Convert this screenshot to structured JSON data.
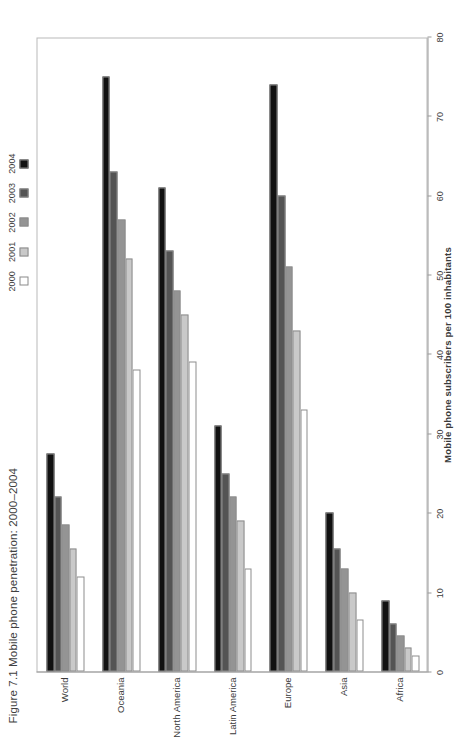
{
  "figure": {
    "title": "Figure 7.1 Mobile phone penetration: 2000–2004"
  },
  "chart_data": {
    "type": "bar",
    "orientation": "horizontal",
    "title": "Figure 7.1 Mobile phone penetration: 2000–2004",
    "xlabel": "Mobile phone subscribers per 100 inhabitants",
    "ylabel": "",
    "axis_title": "Mobile phone subscribers per 100 inhabitants",
    "categories": [
      "Africa",
      "Asia",
      "Europe",
      "Latin America",
      "North America",
      "Oceania",
      "World"
    ],
    "series": [
      {
        "name": "2000",
        "color": "#ffffff",
        "values": [
          2.0,
          6.5,
          33.0,
          13.0,
          39.0,
          38.0,
          12.0
        ]
      },
      {
        "name": "2001",
        "color": "#c9c9c9",
        "values": [
          3.0,
          10.0,
          43.0,
          19.0,
          45.0,
          52.0,
          15.5
        ]
      },
      {
        "name": "2002",
        "color": "#949494",
        "values": [
          4.5,
          13.0,
          51.0,
          22.0,
          48.0,
          57.0,
          18.5
        ]
      },
      {
        "name": "2003",
        "color": "#545454",
        "values": [
          6.0,
          15.5,
          60.0,
          25.0,
          53.0,
          63.0,
          22.0
        ]
      },
      {
        "name": "2004",
        "color": "#111111",
        "values": [
          9.0,
          20.0,
          74.0,
          31.0,
          61.0,
          75.0,
          27.5
        ]
      }
    ],
    "xlim": [
      0,
      80
    ],
    "xticks": [
      0,
      10,
      20,
      30,
      40,
      50,
      60,
      70,
      80
    ],
    "ticklabels": [
      "0",
      "10",
      "20",
      "30",
      "40",
      "50",
      "60",
      "70",
      "80"
    ],
    "grid": false,
    "legend_position": "top",
    "legend_entries": [
      "2000",
      "2001",
      "2002",
      "2003",
      "2004"
    ]
  }
}
